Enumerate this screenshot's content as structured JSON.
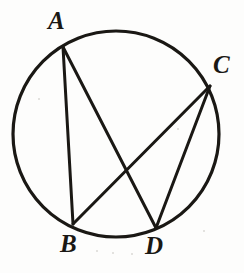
{
  "figure": {
    "background_color": "#fdfdfc",
    "stroke_color": "#1a1814",
    "circle": {
      "name": "circle",
      "center_x": 116,
      "center_y": 134,
      "radius": 103,
      "stroke_width": 3.2
    },
    "points": [
      {
        "id": "A",
        "label": "A",
        "x": 63,
        "y": 47,
        "label_x": 48,
        "label_y": 8
      },
      {
        "id": "C",
        "label": "C",
        "x": 210,
        "y": 86,
        "label_x": 213,
        "label_y": 52
      },
      {
        "id": "B",
        "label": "B",
        "x": 73,
        "y": 224,
        "label_x": 60,
        "label_y": 231
      },
      {
        "id": "D",
        "label": "D",
        "x": 156,
        "y": 228,
        "label_x": 145,
        "label_y": 233
      }
    ],
    "chords": [
      {
        "name": "chord-AB",
        "from": "A",
        "to": "B",
        "x1": 63,
        "y1": 47,
        "x2": 73,
        "y2": 224,
        "stroke_width": 3.0
      },
      {
        "name": "chord-AD",
        "from": "A",
        "to": "D",
        "x1": 63,
        "y1": 47,
        "x2": 156,
        "y2": 228,
        "stroke_width": 3.0
      },
      {
        "name": "chord-BC",
        "from": "B",
        "to": "C",
        "x1": 73,
        "y1": 224,
        "x2": 210,
        "y2": 86,
        "stroke_width": 3.0
      },
      {
        "name": "chord-CD",
        "from": "C",
        "to": "D",
        "x1": 210,
        "y1": 86,
        "x2": 156,
        "y2": 228,
        "stroke_width": 3.0
      }
    ],
    "intersection": {
      "name": "chord-intersection",
      "x": 127,
      "y": 172
    },
    "specks": [
      {
        "x": 96,
        "y": 250,
        "size": 2
      },
      {
        "x": 112,
        "y": 252,
        "size": 2
      },
      {
        "x": 131,
        "y": 253,
        "size": 2
      },
      {
        "x": 203,
        "y": 230,
        "size": 2
      },
      {
        "x": 38,
        "y": 98,
        "size": 2
      },
      {
        "x": 177,
        "y": 128,
        "size": 2
      }
    ]
  }
}
